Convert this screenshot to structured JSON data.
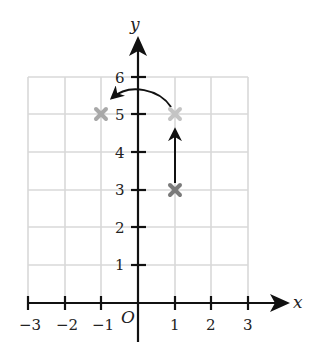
{
  "figure": {
    "type": "coordinate-plane-transformation",
    "axes": {
      "x_label": "x",
      "y_label": "y",
      "origin_label": "O",
      "x_ticks": [
        "−3",
        "−2",
        "−1",
        "1",
        "2",
        "3"
      ],
      "y_ticks": [
        "1",
        "2",
        "3",
        "4",
        "5",
        "6"
      ],
      "x_range": [
        -3,
        3
      ],
      "y_range": [
        0,
        6
      ]
    },
    "points": [
      {
        "name": "original",
        "x": 1,
        "y": 3,
        "marker": "x",
        "color": "#7a7a7a"
      },
      {
        "name": "after-translation",
        "x": 1,
        "y": 5,
        "marker": "x",
        "color": "#bdbdbd"
      },
      {
        "name": "after-reflection",
        "x": -1,
        "y": 5,
        "marker": "x",
        "color": "#a8a8a8"
      }
    ],
    "arrows": [
      {
        "name": "translation-up",
        "from": [
          1,
          3
        ],
        "to": [
          1,
          5
        ],
        "style": "straight"
      },
      {
        "name": "reflection-over-y-axis",
        "from": [
          1,
          5
        ],
        "to": [
          -1,
          5
        ],
        "style": "curved"
      }
    ],
    "colors": {
      "grid": "#d9d9d9",
      "axis": "#111111"
    }
  }
}
